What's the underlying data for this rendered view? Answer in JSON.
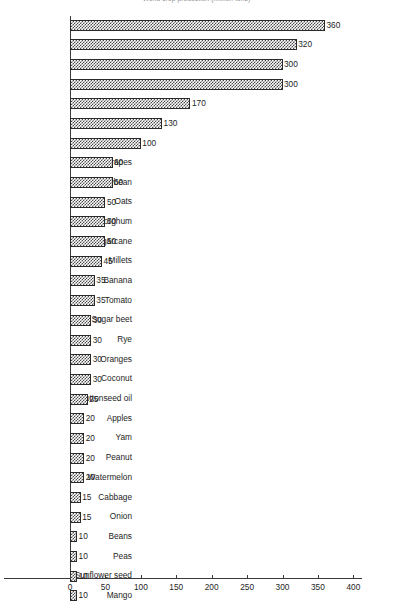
{
  "chart_data": {
    "type": "bar",
    "orientation": "horizontal",
    "title": "World crop production (million tons)",
    "xlabel": "",
    "ylabel": "",
    "xlim": [
      0,
      400
    ],
    "xticks": [
      0,
      50,
      100,
      150,
      200,
      250,
      300,
      350,
      400
    ],
    "grid": false,
    "legend": null,
    "value_labels": true,
    "categories": [
      "Wheat",
      "Rice",
      "Maize",
      "Potato",
      "Barley",
      "Sweet potato",
      "Cassava",
      "Grapes",
      "Soybean",
      "Oats",
      "Sorghum",
      "Sugarcane",
      "Millets",
      "Banana",
      "Tomato",
      "Sugar beet",
      "Rye",
      "Oranges",
      "Coconut",
      "Cottonseed oil",
      "Apples",
      "Yam",
      "Peanut",
      "Watermelon",
      "Cabbage",
      "Onion",
      "Beans",
      "Peas",
      "Sunflower seed",
      "Mango"
    ],
    "values": [
      360,
      320,
      300,
      300,
      170,
      130,
      100,
      60,
      60,
      50,
      50,
      50,
      45,
      35,
      35,
      30,
      30,
      30,
      30,
      25,
      20,
      20,
      20,
      20,
      15,
      15,
      10,
      10,
      10,
      10
    ]
  }
}
